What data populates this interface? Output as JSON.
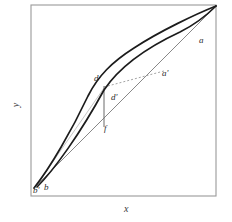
{
  "figure": {
    "type": "line-diagram",
    "background_color": "#ffffff",
    "frame": {
      "name": "plot-frame",
      "x": 31,
      "y": 5,
      "width": 185,
      "height": 191,
      "stroke_color": "#9a9a9a",
      "stroke_width": 1.1
    },
    "axes": {
      "x_label": "x",
      "y_label": "y",
      "x_label_position": {
        "x": 124,
        "y": 208
      },
      "y_label_position": {
        "x": 16,
        "y": 104
      }
    },
    "anchor_points": {
      "origin_corner": {
        "x": 34,
        "y": 188
      },
      "top_right_corner": {
        "x": 216,
        "y": 6
      }
    },
    "point_labels": [
      {
        "id": "label-a",
        "text": "a",
        "x": 199,
        "y": 36
      },
      {
        "id": "label-a-prime",
        "text": "a'",
        "x": 162,
        "y": 69
      },
      {
        "id": "label-d",
        "text": "d",
        "x": 94,
        "y": 74
      },
      {
        "id": "label-d-prime",
        "text": "d'",
        "x": 111,
        "y": 93
      },
      {
        "id": "label-f",
        "text": "f",
        "x": 104,
        "y": 124
      },
      {
        "id": "label-b-prime",
        "text": "b'",
        "x": 33,
        "y": 186
      },
      {
        "id": "label-b",
        "text": "b",
        "x": 44,
        "y": 183
      }
    ],
    "curves": [
      {
        "id": "upper-curve",
        "name": "upper-bowed-curve",
        "description": "outermost concave curve from b' to top-right corner through d",
        "stroke_color": "#1c1c1c",
        "stroke_width": 1.7,
        "dash": "none",
        "path": "M 34 188 C 50 168 72 130 88 96 C 98 76 112 62 134 48 C 160 31 196 14 216 6"
      },
      {
        "id": "lower-curve",
        "name": "lower-bowed-curve",
        "description": "inner concave curve from b to top-right corner through d' region and a",
        "stroke_color": "#1c1c1c",
        "stroke_width": 1.7,
        "dash": "none",
        "path": "M 37 187 C 54 170 80 134 104 90 C 120 66 150 46 180 32 C 196 24 209 13 216 6"
      },
      {
        "id": "chord-line",
        "name": "straight-chord-b-to-corner",
        "description": "thin straight line from b' to top-right corner",
        "stroke_color": "#7a7a7a",
        "stroke_width": 0.9,
        "dash": "none",
        "path": "M 34 188 L 216 6"
      },
      {
        "id": "vertical-segment",
        "name": "vertical-segment-d-to-f",
        "description": "vertical line dropping from d down to f on the chord",
        "stroke_color": "#6a6a6a",
        "stroke_width": 1.0,
        "dash": "none",
        "path": "M 104 86 L 104 127"
      },
      {
        "id": "dashed-segment",
        "name": "dashed-segment-d-to-a-prime",
        "description": "dashed line from d across to a'",
        "stroke_color": "#9a9a9a",
        "stroke_width": 0.9,
        "dash": "2,2",
        "path": "M 104 87 L 164 71"
      },
      {
        "id": "faint-lower-left-line",
        "name": "faint-line-b-to-d",
        "description": "faint light line running from bottom-left up to d",
        "stroke_color": "#c0c0c0",
        "stroke_width": 0.9,
        "dash": "none",
        "path": "M 36 186 L 104 88"
      }
    ]
  }
}
